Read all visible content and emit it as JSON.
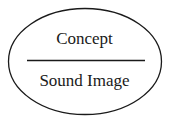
{
  "diagram": {
    "type": "saussurean-sign",
    "top_label": "Concept",
    "bottom_label": "Sound Image",
    "stroke_color": "#1a1a1a",
    "background_color": "#ffffff"
  }
}
